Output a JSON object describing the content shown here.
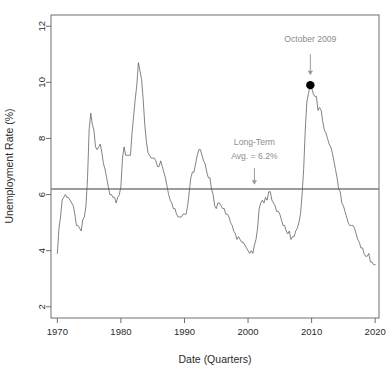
{
  "chart_data": {
    "type": "line",
    "title": "",
    "xlabel": "Date (Quarters)",
    "ylabel": "Unemployment Rate (%)",
    "xlim": [
      1969.0,
      2020.6
    ],
    "ylim": [
      1.6,
      12.4
    ],
    "xticks": [
      1970,
      1980,
      1990,
      2000,
      2010,
      2020
    ],
    "xtick_labels": [
      "1970",
      "1980",
      "1990",
      "2000",
      "2010",
      "2020"
    ],
    "yticks": [
      2,
      4,
      6,
      8,
      10,
      12
    ],
    "ytick_labels": [
      "2",
      "4",
      "6",
      "8",
      "10",
      "12"
    ],
    "grid": false,
    "legend": "none",
    "line_color": "#5a5a5a",
    "reference_line": {
      "name": "long-term-average",
      "value": 6.2,
      "orientation": "horizontal",
      "color": "#7a7a7a",
      "label_line1": "Long-Term",
      "label_line2": "Avg. = 6.2%",
      "label_x": 2001.0,
      "label_y1": 7.75,
      "label_y2": 7.25,
      "arrow_x": 2001.0,
      "arrow_y_start": 6.95,
      "arrow_y_end": 6.35
    },
    "annotations": [
      {
        "name": "october-2009-peak",
        "text": "October 2009",
        "text_x": 2009.8,
        "text_y": 11.45,
        "point_x": 2009.8,
        "point_y": 9.9,
        "marker": "filled-circle",
        "marker_color": "#000000",
        "arrow_y_start": 11.0,
        "arrow_y_end": 10.25
      }
    ],
    "series": [
      {
        "name": "US Unemployment Rate",
        "x": [
          1970.0,
          1970.25,
          1970.5,
          1970.75,
          1971.0,
          1971.25,
          1971.5,
          1971.75,
          1972.0,
          1972.25,
          1972.5,
          1972.75,
          1973.0,
          1973.25,
          1973.5,
          1973.75,
          1974.0,
          1974.25,
          1974.5,
          1974.75,
          1975.0,
          1975.25,
          1975.5,
          1975.75,
          1976.0,
          1976.25,
          1976.5,
          1976.75,
          1977.0,
          1977.25,
          1977.5,
          1977.75,
          1978.0,
          1978.25,
          1978.5,
          1978.75,
          1979.0,
          1979.25,
          1979.5,
          1979.75,
          1980.0,
          1980.25,
          1980.5,
          1980.75,
          1981.0,
          1981.25,
          1981.5,
          1981.75,
          1982.0,
          1982.25,
          1982.5,
          1982.75,
          1983.0,
          1983.25,
          1983.5,
          1983.75,
          1984.0,
          1984.25,
          1984.5,
          1984.75,
          1985.0,
          1985.25,
          1985.5,
          1985.75,
          1986.0,
          1986.25,
          1986.5,
          1986.75,
          1987.0,
          1987.25,
          1987.5,
          1987.75,
          1988.0,
          1988.25,
          1988.5,
          1988.75,
          1989.0,
          1989.25,
          1989.5,
          1989.75,
          1990.0,
          1990.25,
          1990.5,
          1990.75,
          1991.0,
          1991.25,
          1991.5,
          1991.75,
          1992.0,
          1992.25,
          1992.5,
          1992.75,
          1993.0,
          1993.25,
          1993.5,
          1993.75,
          1994.0,
          1994.25,
          1994.5,
          1994.75,
          1995.0,
          1995.25,
          1995.5,
          1995.75,
          1996.0,
          1996.25,
          1996.5,
          1996.75,
          1997.0,
          1997.25,
          1997.5,
          1997.75,
          1998.0,
          1998.25,
          1998.5,
          1998.75,
          1999.0,
          1999.25,
          1999.5,
          1999.75,
          2000.0,
          2000.25,
          2000.5,
          2000.75,
          2001.0,
          2001.25,
          2001.5,
          2001.75,
          2002.0,
          2002.25,
          2002.5,
          2002.75,
          2003.0,
          2003.25,
          2003.5,
          2003.75,
          2004.0,
          2004.25,
          2004.5,
          2004.75,
          2005.0,
          2005.25,
          2005.5,
          2005.75,
          2006.0,
          2006.25,
          2006.5,
          2006.75,
          2007.0,
          2007.25,
          2007.5,
          2007.75,
          2008.0,
          2008.25,
          2008.5,
          2008.75,
          2009.0,
          2009.25,
          2009.5,
          2009.75,
          2010.0,
          2010.25,
          2010.5,
          2010.75,
          2011.0,
          2011.25,
          2011.5,
          2011.75,
          2012.0,
          2012.25,
          2012.5,
          2012.75,
          2013.0,
          2013.25,
          2013.5,
          2013.75,
          2014.0,
          2014.25,
          2014.5,
          2014.75,
          2015.0,
          2015.25,
          2015.5,
          2015.75,
          2016.0,
          2016.25,
          2016.5,
          2016.75,
          2017.0,
          2017.25,
          2017.5,
          2017.75,
          2018.0,
          2018.25,
          2018.5,
          2018.75,
          2019.0,
          2019.25,
          2019.5,
          2019.75,
          2020.0
        ],
        "values": [
          3.9,
          4.8,
          5.2,
          5.8,
          5.9,
          6.0,
          5.9,
          5.9,
          5.8,
          5.7,
          5.6,
          5.3,
          4.9,
          4.9,
          4.8,
          4.7,
          5.1,
          5.2,
          5.6,
          6.6,
          8.3,
          8.9,
          8.5,
          8.3,
          7.7,
          7.6,
          7.7,
          7.8,
          7.5,
          7.1,
          6.9,
          6.6,
          6.3,
          6.0,
          6.0,
          5.9,
          5.9,
          5.7,
          5.9,
          6.0,
          6.3,
          7.3,
          7.7,
          7.4,
          7.4,
          7.4,
          7.4,
          8.2,
          8.8,
          9.4,
          9.9,
          10.7,
          10.4,
          10.1,
          9.4,
          8.5,
          7.9,
          7.5,
          7.4,
          7.3,
          7.3,
          7.3,
          7.2,
          7.0,
          7.0,
          7.2,
          7.0,
          6.8,
          6.6,
          6.3,
          6.0,
          5.8,
          5.7,
          5.5,
          5.5,
          5.3,
          5.2,
          5.2,
          5.2,
          5.3,
          5.3,
          5.3,
          5.6,
          6.1,
          6.6,
          6.8,
          6.8,
          7.1,
          7.4,
          7.6,
          7.6,
          7.4,
          7.2,
          7.1,
          6.8,
          6.6,
          6.6,
          6.2,
          6.0,
          5.6,
          5.5,
          5.7,
          5.7,
          5.6,
          5.5,
          5.5,
          5.3,
          5.3,
          5.2,
          5.0,
          4.9,
          4.7,
          4.6,
          4.4,
          4.5,
          4.4,
          4.3,
          4.3,
          4.2,
          4.1,
          4.0,
          3.9,
          4.0,
          3.9,
          4.2,
          4.4,
          4.8,
          5.5,
          5.7,
          5.8,
          5.7,
          5.9,
          5.8,
          6.1,
          6.1,
          5.8,
          5.7,
          5.6,
          5.4,
          5.4,
          5.3,
          5.1,
          4.9,
          4.9,
          4.7,
          4.6,
          4.7,
          4.4,
          4.5,
          4.5,
          4.7,
          4.8,
          5.0,
          5.3,
          6.0,
          6.9,
          8.3,
          9.3,
          9.6,
          9.9,
          9.8,
          9.6,
          9.5,
          9.5,
          9.0,
          9.1,
          9.0,
          8.6,
          8.3,
          8.2,
          8.0,
          7.8,
          7.7,
          7.5,
          7.2,
          6.9,
          6.6,
          6.2,
          6.1,
          5.7,
          5.6,
          5.4,
          5.2,
          5.0,
          4.9,
          4.9,
          4.9,
          4.8,
          4.6,
          4.4,
          4.3,
          4.1,
          4.1,
          3.9,
          3.8,
          3.8,
          3.9,
          3.6,
          3.6,
          3.5,
          3.5
        ]
      }
    ]
  },
  "layout": {
    "plot_left": 51,
    "plot_right": 379,
    "plot_top": 15,
    "plot_bottom": 318
  }
}
